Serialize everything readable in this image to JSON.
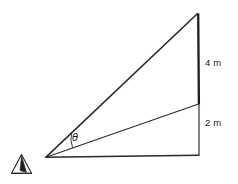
{
  "figure": {
    "type": "geometry-diagram",
    "background_color": "#ffffff",
    "stroke_color": "#2b2b2b",
    "canvas": {
      "width": 238,
      "height": 184
    },
    "labels": {
      "top_segment": "4 m",
      "bottom_segment": "2 m",
      "angle": "θ"
    },
    "icons": {
      "observer": "eye-observer-icon"
    },
    "points": {
      "observer": {
        "x": 46,
        "y": 157
      },
      "base_right": {
        "x": 199,
        "y": 155
      },
      "mid_right": {
        "x": 199,
        "y": 104
      },
      "apex": {
        "x": 198,
        "y": 13
      }
    },
    "segments": [
      {
        "name": "sight-line-to-apex",
        "from": "observer",
        "to": "apex",
        "weight": 1.6
      },
      {
        "name": "sight-line-to-mid",
        "from": "observer",
        "to": "mid_right",
        "weight": 1.2
      },
      {
        "name": "ground-line",
        "from": "observer",
        "to": "base_right",
        "weight": 1.4
      },
      {
        "name": "upper-vertical-4m",
        "from": "mid_right",
        "to": "apex",
        "weight": 2.2
      },
      {
        "name": "lower-vertical-2m",
        "from": "base_right",
        "to": "mid_right",
        "weight": 1.2
      }
    ],
    "angle_arc": {
      "name": "theta-arc",
      "vertex": "observer",
      "radius": 26
    }
  }
}
